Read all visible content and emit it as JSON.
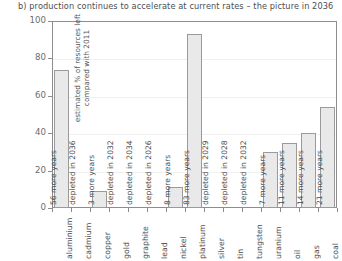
{
  "chart_data": {
    "type": "bar",
    "title": "b) production continues to accelerate at current rates – the picture in 2036",
    "xlabel": "",
    "ylabel": "estimated % of resources left compared with 2011",
    "ylim": [
      0,
      100
    ],
    "yticks": [
      0,
      20,
      40,
      60,
      80,
      100
    ],
    "grid": true,
    "legend": "none",
    "categories": [
      "aluminium",
      "cadmium",
      "copper",
      "gold",
      "graphite",
      "lead",
      "nickel",
      "platinum",
      "silver",
      "tin",
      "tungsten",
      "uranium",
      "oil",
      "gas",
      "coal"
    ],
    "values": [
      74,
      0,
      9,
      0,
      0,
      0,
      11,
      93,
      0,
      0,
      0,
      30,
      35,
      40,
      54
    ],
    "annotations": [
      "56 more years",
      "depleted in 2036",
      "3 more years",
      "depleted in 2032",
      "depleted in 2034",
      "depleted in 2026",
      "8 more years",
      "83 more years",
      "depleted in 2029",
      "depleted in 2028",
      "depleted in 2032",
      "7 more years",
      "11 more years",
      "14 more years",
      "21 more years"
    ],
    "bar_fill": "#e9e9e9",
    "bar_border": "#9a9a9c",
    "text_color": "#4d4d4f",
    "frame_color": "#8d8d8f"
  }
}
